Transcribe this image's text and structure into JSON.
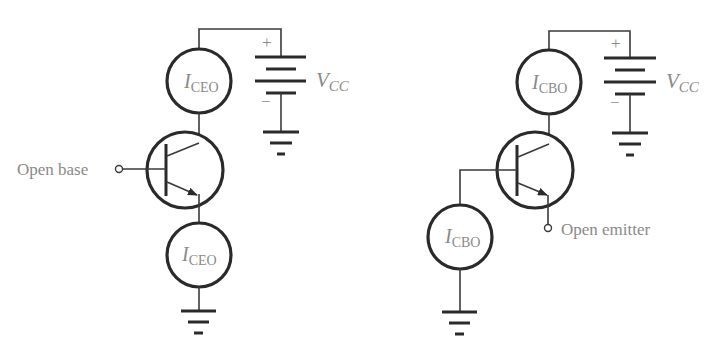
{
  "figure": {
    "left_circuit": {
      "name": "open-base",
      "top_source_label": {
        "main": "I",
        "sub": "CEO"
      },
      "bottom_source_label": {
        "main": "I",
        "sub": "CEO"
      },
      "supply_label": {
        "main": "V",
        "sub": "CC"
      },
      "plus_sign": "+",
      "minus_sign": "−",
      "terminal_label": "Open base"
    },
    "right_circuit": {
      "name": "open-emitter",
      "top_source_label": {
        "main": "I",
        "sub": "CBO"
      },
      "bottom_source_label": {
        "main": "I",
        "sub": "CBO"
      },
      "supply_label": {
        "main": "V",
        "sub": "CC"
      },
      "plus_sign": "+",
      "minus_sign": "−",
      "terminal_label": "Open emitter"
    }
  }
}
